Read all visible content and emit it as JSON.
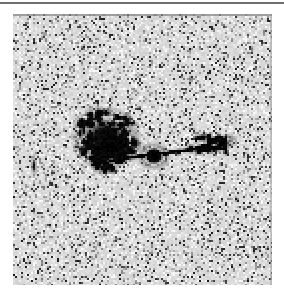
{
  "page": {
    "background_color": "#ffffff",
    "width": 284,
    "height": 298
  },
  "top_rule": {
    "color": "#6f6f6f",
    "thickness": 2
  },
  "figure": {
    "caption": "",
    "alt_text": "Grayscale astronomical image: a bright compact core with a thin linear jet extending to the right toward a forked knot, and a large diffuse lobe to the left, on a noisy gray sky background."
  },
  "image_panel": {
    "background_color": "#d9d9d9",
    "border_color": "#8a8a8a",
    "x": 13,
    "y": 14,
    "width": 259,
    "height": 271,
    "noise": {
      "seed": 20240137,
      "cell_size": 2,
      "density": 0.17,
      "dark_color": "#2e2e2e",
      "mid_color": "#8f8f8f",
      "light_color": "#efefef",
      "base_color": "#d9d9d9"
    },
    "features": [
      {
        "name": "left-lobe",
        "type": "diffuse-blob",
        "cx": 93,
        "cy": 124,
        "rx": 31,
        "ry": 27,
        "intensity": 0.92
      },
      {
        "name": "left-lobe-core",
        "type": "dense-blob",
        "cx": 97,
        "cy": 133,
        "rx": 23,
        "ry": 14,
        "intensity": 1.0
      },
      {
        "name": "core",
        "type": "point-source",
        "cx": 141,
        "cy": 142,
        "rx": 9,
        "ry": 8,
        "intensity": 1.0
      },
      {
        "name": "jet",
        "type": "linear-jet",
        "x1": 120,
        "y1": 143,
        "x2": 208,
        "y2": 132,
        "width": 3,
        "intensity": 1.0
      },
      {
        "name": "right-knot",
        "type": "forked-knot",
        "cx": 197,
        "cy": 131,
        "rx": 17,
        "ry": 11,
        "intensity": 1.0
      },
      {
        "name": "edge-streak",
        "type": "vertical-streak",
        "cx": 21,
        "cy": 152,
        "rx": 2,
        "ry": 9,
        "intensity": 0.6
      }
    ]
  }
}
